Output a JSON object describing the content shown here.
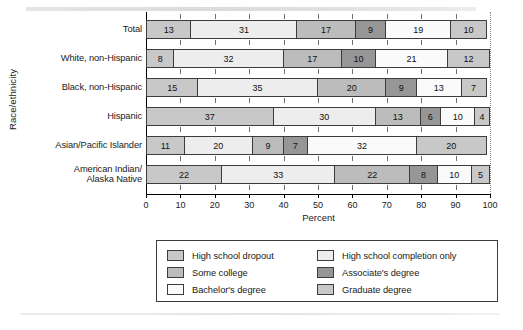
{
  "chart_data": {
    "type": "bar",
    "orientation": "horizontal",
    "stacked": true,
    "title": "",
    "xlabel": "Percent",
    "ylabel": "Race/ethnicity",
    "xlim": [
      0,
      100
    ],
    "xticks": [
      0,
      10,
      20,
      30,
      40,
      50,
      60,
      70,
      80,
      90,
      100
    ],
    "grid": false,
    "legend_position": "bottom",
    "categories": [
      "Total",
      "White, non-Hispanic",
      "Black, non-Hispanic",
      "Hispanic",
      "Asian/Pacific Islander",
      "American Indian/\nAlaska Native"
    ],
    "series": [
      {
        "name": "High school dropout",
        "color": "#c8c8c8",
        "values": [
          13,
          8,
          15,
          37,
          11,
          22
        ]
      },
      {
        "name": "High school completion only",
        "color": "#ededed",
        "values": [
          31,
          32,
          35,
          30,
          20,
          33
        ]
      },
      {
        "name": "Some college",
        "color": "#bcbcbc",
        "values": [
          17,
          17,
          20,
          13,
          9,
          22
        ]
      },
      {
        "name": "Associate's degree",
        "color": "#969696",
        "values": [
          9,
          10,
          9,
          6,
          7,
          8
        ]
      },
      {
        "name": "Bachelor's degree",
        "color": "#fafafa",
        "values": [
          19,
          21,
          13,
          10,
          32,
          10
        ]
      },
      {
        "name": "Graduate degree",
        "color": "#c8c8c8",
        "values": [
          10,
          12,
          7,
          4,
          20,
          5
        ]
      }
    ]
  },
  "legend": {
    "entries": [
      {
        "label": "High school dropout",
        "color": "#c8c8c8"
      },
      {
        "label": "High school completion only",
        "color": "#ededed"
      },
      {
        "label": "Some college",
        "color": "#bcbcbc"
      },
      {
        "label": "Associate's degree",
        "color": "#969696"
      },
      {
        "label": "Bachelor's degree",
        "color": "#fafafa"
      },
      {
        "label": "Graduate degree",
        "color": "#c8c8c8"
      }
    ]
  }
}
